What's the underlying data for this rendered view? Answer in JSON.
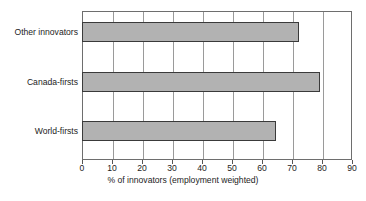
{
  "chart_data": {
    "type": "bar",
    "orientation": "horizontal",
    "title": "",
    "subtitle": "",
    "categories": [
      "Other innovators",
      "Canada-firsts",
      "World-firsts"
    ],
    "values": [
      72.3,
      79.4,
      64.8
    ],
    "series": [
      {
        "name": "% of innovators (employment weighted)",
        "values": [
          72.3,
          79.4,
          64.8
        ]
      }
    ],
    "xlabel": "% of innovators (employment weighted)",
    "ylabel": "",
    "xlim": [
      0,
      90
    ],
    "xticks": [
      0,
      10,
      20,
      30,
      40,
      50,
      60,
      70,
      80,
      90
    ],
    "xtick_labels": [
      "0",
      "10",
      "20",
      "30",
      "40",
      "50",
      "60",
      "70",
      "80",
      "90"
    ],
    "xtick_step": 10,
    "grid": "vertical",
    "legend": "none",
    "bar_fill_color": "#b2b2b2",
    "bar_border_color": "#3a3a3a",
    "gridline_color": "#9a9a9a",
    "frame_color": "#6e6e6e",
    "annotations": []
  },
  "caption": {
    "text": "",
    "visible_fragment": ""
  }
}
